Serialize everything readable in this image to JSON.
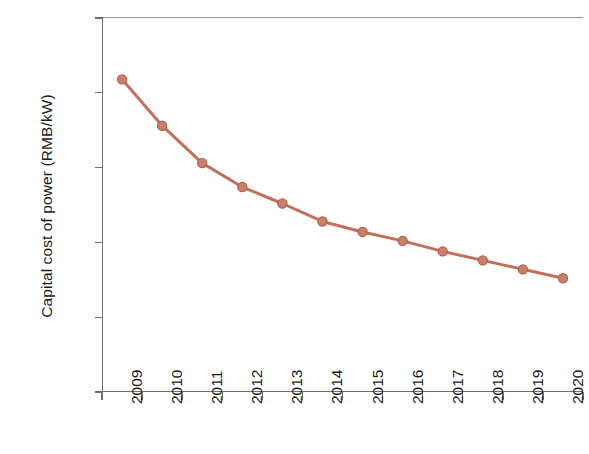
{
  "chart_data": {
    "type": "line",
    "title": "",
    "subtitle": "",
    "xlabel": "",
    "ylabel": "Capital cost of power (RMB/kW)",
    "categories": [
      "2009",
      "2010",
      "2011",
      "2012",
      "2013",
      "2014",
      "2015",
      "2016",
      "2017",
      "2018",
      "2019",
      "2020"
    ],
    "x": [
      2009,
      2010,
      2011,
      2012,
      2013,
      2014,
      2015,
      2016,
      2017,
      2018,
      2019,
      2020
    ],
    "values": [
      8590,
      8280,
      8030,
      7870,
      7760,
      7640,
      7570,
      7510,
      7440,
      7380,
      7320,
      7260
    ],
    "series": [
      {
        "name": "Capital cost of power",
        "values": [
          8590,
          8280,
          8030,
          7870,
          7760,
          7640,
          7570,
          7510,
          7440,
          7380,
          7320,
          7260
        ],
        "color": "#c1705c",
        "marker": "circle",
        "line_width": 3
      }
    ],
    "ylim": [
      6500,
      9000
    ],
    "yticks": [
      6500,
      7000,
      7500,
      8000,
      8500,
      9000
    ],
    "ytick_labels": [
      "6500",
      "7000",
      "7500",
      "8000",
      "8500",
      "9000"
    ],
    "xtick_labels": [
      "2009",
      "2010",
      "2011",
      "2012",
      "2013",
      "2014",
      "2015",
      "2016",
      "2017",
      "2018",
      "2019",
      "2020"
    ],
    "xtick_rotation": -90,
    "grid": false,
    "legend": false,
    "legend_position": "none",
    "annotations": []
  },
  "colors": {
    "series_line": "#c1705c",
    "marker_fill": "#c8806c",
    "marker_edge": "#b1604c",
    "axis": "#6f6f6f",
    "text": "#1b1b1b",
    "background": "#ffffff"
  },
  "axes": {
    "y_title": "Capital cost of power (RMB/kW)",
    "y_labels": [
      "9000",
      "8500",
      "8000",
      "7500",
      "7000",
      "6500"
    ],
    "x_labels": [
      "2009",
      "2010",
      "2011",
      "2012",
      "2013",
      "2014",
      "2015",
      "2016",
      "2017",
      "2018",
      "2019",
      "2020"
    ]
  }
}
